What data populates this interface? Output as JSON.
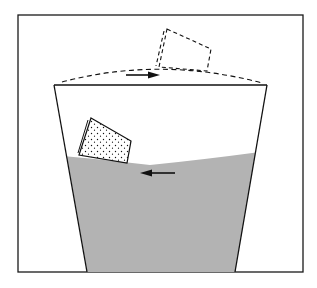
{
  "figure": {
    "colors": {
      "background": "#ffffff",
      "frame": "#1a1a1a",
      "line": "#111111",
      "water": "#b3b3b3"
    },
    "elements": [
      {
        "id": "frame",
        "label": "figure border"
      },
      {
        "id": "glass",
        "label": "tapered glass outline"
      },
      {
        "id": "water",
        "label": "water with concave meniscus"
      },
      {
        "id": "overfill-meniscus",
        "label": "dashed convex meniscus above rim"
      },
      {
        "id": "cork-dashed",
        "label": "dashed cork at top of convex meniscus"
      },
      {
        "id": "cork-dotted",
        "label": "dotted cork at glass wall"
      },
      {
        "id": "arrow-right",
        "label": "arrow pointing right (toward center)"
      },
      {
        "id": "arrow-left",
        "label": "arrow pointing left (toward wall)"
      }
    ]
  }
}
